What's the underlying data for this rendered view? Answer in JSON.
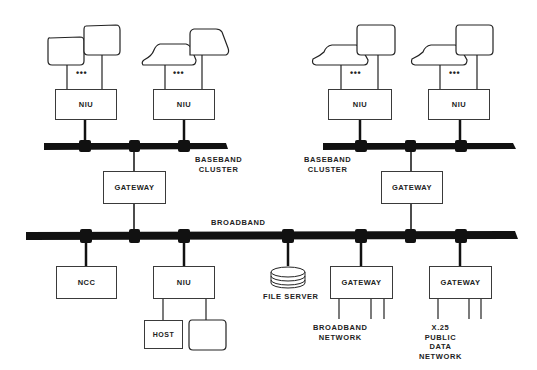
{
  "diagram": {
    "type": "network-topology",
    "buses": {
      "baseband_left": "BASEBAND CLUSTER",
      "baseband_right": "BASEBAND CLUSTER",
      "broadband": "BROADBAND"
    },
    "labels": {
      "baseband_left_line1": "BASEBAND",
      "baseband_left_line2": "CLUSTER",
      "baseband_right_line1": "BASEBAND",
      "baseband_right_line2": "CLUSTER",
      "broadband": "BROADBAND",
      "file_server": "FILE SERVER",
      "broadband_network_line1": "BROADBAND",
      "broadband_network_line2": "NETWORK",
      "x25_line1": "X.25",
      "x25_line2": "PUBLIC",
      "x25_line3": "DATA",
      "x25_line4": "NETWORK",
      "ellipsis": "•••"
    },
    "nodes": {
      "niu_top_1": "NIU",
      "niu_top_2": "NIU",
      "niu_top_3": "NIU",
      "niu_top_4": "NIU",
      "gateway_left": "GATEWAY",
      "gateway_right": "GATEWAY",
      "ncc": "NCC",
      "niu_bottom": "NIU",
      "host": "HOST",
      "gateway_broadband_net": "GATEWAY",
      "gateway_x25": "GATEWAY"
    },
    "colors": {
      "line": "#111111",
      "box_border": "#3a3a3a",
      "background": "#ffffff"
    }
  }
}
